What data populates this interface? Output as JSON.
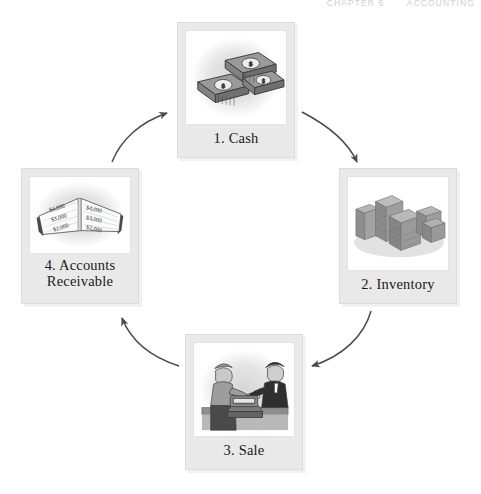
{
  "header": {
    "chapter": "CHAPTER 6",
    "title": "ACCOUNTING"
  },
  "diagram": {
    "type": "cycle",
    "direction": "clockwise",
    "nodes": [
      {
        "id": "cash",
        "label": "1. Cash",
        "number": "1",
        "name": "Cash",
        "icon": "money-stacks-icon",
        "currency_symbol": "$"
      },
      {
        "id": "inventory",
        "label": "2. Inventory",
        "number": "2",
        "name": "Inventory",
        "icon": "stacked-crates-icon"
      },
      {
        "id": "sale",
        "label": "3. Sale",
        "number": "3",
        "name": "Sale",
        "icon": "cash-register-sale-icon"
      },
      {
        "id": "ar",
        "label_line1": "4. Accounts",
        "label_line2": "Receivable",
        "number": "4",
        "name": "Accounts Receivable",
        "icon": "open-ledger-book-icon",
        "ledger_amounts_left": [
          "$4,000",
          "$3,000",
          "$2,000"
        ],
        "ledger_amounts_right": [
          "$4,000",
          "$3,000",
          "$2,000"
        ]
      }
    ],
    "arrows": [
      {
        "id": "cash-to-inventory",
        "from": "cash",
        "to": "inventory"
      },
      {
        "id": "inventory-to-sale",
        "from": "inventory",
        "to": "sale"
      },
      {
        "id": "sale-to-ar",
        "from": "sale",
        "to": "ar"
      },
      {
        "id": "ar-to-cash",
        "from": "ar",
        "to": "cash"
      }
    ]
  },
  "colors": {
    "frame": "#e9e9e9",
    "frame_border": "#dcdcdc",
    "photo_bg": "#ffffff",
    "arrow": "#4a4a4a",
    "text": "#1a1a1a",
    "header_text": "#cfcfcf"
  }
}
